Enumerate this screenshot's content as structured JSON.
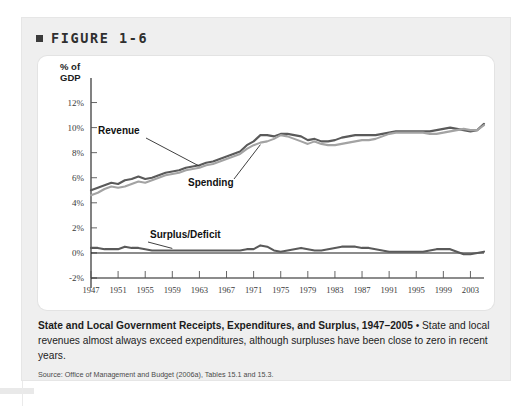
{
  "figure": {
    "bullet_icon": "square-bullet-icon",
    "label": "FIGURE 1-6"
  },
  "caption": {
    "title": "State and Local Government Receipts, Expenditures, and Surplus, 1947–2005",
    "separator": " • ",
    "body": "State and local revenues almost always exceed expenditures, although surpluses have been close to zero in recent years."
  },
  "source": {
    "text": "Source: Office of Management and Budget (2006a), Tables 15.1 and 15.3."
  },
  "chart_data": {
    "type": "line",
    "title": "State and Local Government Receipts, Expenditures, and Surplus, 1947–2005",
    "xlabel": "",
    "ylabel": "% of GDP",
    "ylabel_line1": "% of",
    "ylabel_line2": "GDP",
    "grid": false,
    "legend": "inline-annotations",
    "xlim": [
      1947,
      2005
    ],
    "ylim": [
      -2,
      13
    ],
    "yticks": [
      12,
      10,
      8,
      6,
      4,
      2,
      0,
      -2
    ],
    "ytick_labels": [
      "12%",
      "10%",
      "8%",
      "6%",
      "4%",
      "2%",
      "0%",
      "-2%"
    ],
    "xticks": [
      1947,
      1951,
      1955,
      1959,
      1963,
      1967,
      1971,
      1975,
      1979,
      1983,
      1987,
      1991,
      1995,
      1999,
      2003
    ],
    "xtick_labels": [
      "1947",
      "1951",
      "1955",
      "1959",
      "1963",
      "1967",
      "1971",
      "1975",
      "1979",
      "1983",
      "1987",
      "1991",
      "1995",
      "1999",
      "2003"
    ],
    "zero_line": 0,
    "colors": {
      "revenue": "#5a5a5a",
      "spending": "#a3a3a3",
      "surplus": "#5a5a5a",
      "axis": "#1a1a1a"
    },
    "x": [
      1947,
      1948,
      1949,
      1950,
      1951,
      1952,
      1953,
      1954,
      1955,
      1956,
      1957,
      1958,
      1959,
      1960,
      1961,
      1962,
      1963,
      1964,
      1965,
      1966,
      1967,
      1968,
      1969,
      1970,
      1971,
      1972,
      1973,
      1974,
      1975,
      1976,
      1977,
      1978,
      1979,
      1980,
      1981,
      1982,
      1983,
      1984,
      1985,
      1986,
      1987,
      1988,
      1989,
      1990,
      1991,
      1992,
      1993,
      1994,
      1995,
      1996,
      1997,
      1998,
      1999,
      2000,
      2001,
      2002,
      2003,
      2004,
      2005
    ],
    "series": [
      {
        "name": "Revenue",
        "label": "Revenue",
        "color": "#5a5a5a",
        "values": [
          5.0,
          5.2,
          5.4,
          5.6,
          5.5,
          5.8,
          5.9,
          6.1,
          5.9,
          6.0,
          6.2,
          6.4,
          6.5,
          6.6,
          6.8,
          6.9,
          7.0,
          7.2,
          7.3,
          7.5,
          7.7,
          7.9,
          8.1,
          8.6,
          8.9,
          9.4,
          9.4,
          9.3,
          9.5,
          9.5,
          9.4,
          9.3,
          9.0,
          9.1,
          8.9,
          8.9,
          9.0,
          9.2,
          9.3,
          9.4,
          9.4,
          9.4,
          9.4,
          9.5,
          9.6,
          9.7,
          9.7,
          9.7,
          9.7,
          9.7,
          9.7,
          9.8,
          9.9,
          10.0,
          9.9,
          9.8,
          9.7,
          9.8,
          10.3
        ]
      },
      {
        "name": "Spending",
        "label": "Spending",
        "color": "#a3a3a3",
        "values": [
          4.6,
          4.8,
          5.1,
          5.3,
          5.2,
          5.3,
          5.5,
          5.7,
          5.6,
          5.8,
          6.0,
          6.2,
          6.3,
          6.4,
          6.6,
          6.7,
          6.8,
          7.0,
          7.1,
          7.3,
          7.5,
          7.7,
          7.9,
          8.3,
          8.6,
          8.8,
          8.9,
          9.1,
          9.4,
          9.3,
          9.1,
          8.9,
          8.7,
          8.9,
          8.7,
          8.6,
          8.6,
          8.7,
          8.8,
          8.9,
          9.0,
          9.0,
          9.1,
          9.3,
          9.5,
          9.6,
          9.6,
          9.6,
          9.6,
          9.6,
          9.5,
          9.5,
          9.6,
          9.7,
          9.8,
          9.9,
          9.8,
          9.8,
          10.2
        ]
      },
      {
        "name": "Surplus/Deficit",
        "label": "Surplus/Deficit",
        "color": "#5a5a5a",
        "values": [
          0.4,
          0.4,
          0.3,
          0.3,
          0.3,
          0.5,
          0.4,
          0.4,
          0.3,
          0.2,
          0.2,
          0.2,
          0.2,
          0.2,
          0.2,
          0.2,
          0.2,
          0.2,
          0.2,
          0.2,
          0.2,
          0.2,
          0.2,
          0.3,
          0.3,
          0.6,
          0.5,
          0.2,
          0.1,
          0.2,
          0.3,
          0.4,
          0.3,
          0.2,
          0.2,
          0.3,
          0.4,
          0.5,
          0.5,
          0.5,
          0.4,
          0.4,
          0.3,
          0.2,
          0.1,
          0.1,
          0.1,
          0.1,
          0.1,
          0.1,
          0.2,
          0.3,
          0.3,
          0.3,
          0.1,
          -0.1,
          -0.1,
          0.0,
          0.1
        ]
      }
    ],
    "annotations": [
      {
        "text": "Revenue",
        "series": "Revenue"
      },
      {
        "text": "Spending",
        "series": "Spending"
      },
      {
        "text": "Surplus/Deficit",
        "series": "Surplus/Deficit"
      }
    ]
  }
}
